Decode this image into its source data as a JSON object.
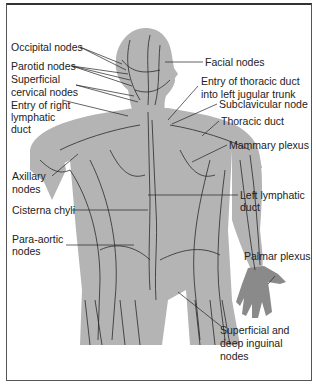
{
  "figure": {
    "colors": {
      "body": "#b4b4b4",
      "vessels": "#2a2a2a",
      "text": "#222222",
      "border": "#555555"
    },
    "labels": [
      {
        "id": "occipital",
        "text": "Occipital nodes"
      },
      {
        "id": "parotid",
        "text": "Parotid nodes"
      },
      {
        "id": "superficial-cervical-1",
        "text": "Superficial"
      },
      {
        "id": "superficial-cervical-2",
        "text": "cervical nodes"
      },
      {
        "id": "entry-right-1",
        "text": "Entry of right"
      },
      {
        "id": "entry-right-2",
        "text": "lymphatic"
      },
      {
        "id": "entry-right-3",
        "text": "duct"
      },
      {
        "id": "axillary-1",
        "text": "Axillary"
      },
      {
        "id": "axillary-2",
        "text": "nodes"
      },
      {
        "id": "cisterna",
        "text": "Cisterna chyli"
      },
      {
        "id": "para-aortic-1",
        "text": "Para-aortic"
      },
      {
        "id": "para-aortic-2",
        "text": "nodes"
      },
      {
        "id": "facial",
        "text": "Facial nodes"
      },
      {
        "id": "entry-thoracic-1",
        "text": "Entry of thoracic duct"
      },
      {
        "id": "entry-thoracic-2",
        "text": "into left jugular trunk"
      },
      {
        "id": "subclavicular",
        "text": "Subclavicular node"
      },
      {
        "id": "thoracic",
        "text": "Thoracic duct"
      },
      {
        "id": "mammary",
        "text": "Mammary plexus"
      },
      {
        "id": "left-lymphatic-1",
        "text": "Left lymphatic"
      },
      {
        "id": "left-lymphatic-2",
        "text": "duct"
      },
      {
        "id": "palmar",
        "text": "Palmar plexus"
      },
      {
        "id": "inguinal-1",
        "text": "Superficial and"
      },
      {
        "id": "inguinal-2",
        "text": "deep inguinal"
      },
      {
        "id": "inguinal-3",
        "text": "nodes"
      }
    ]
  }
}
